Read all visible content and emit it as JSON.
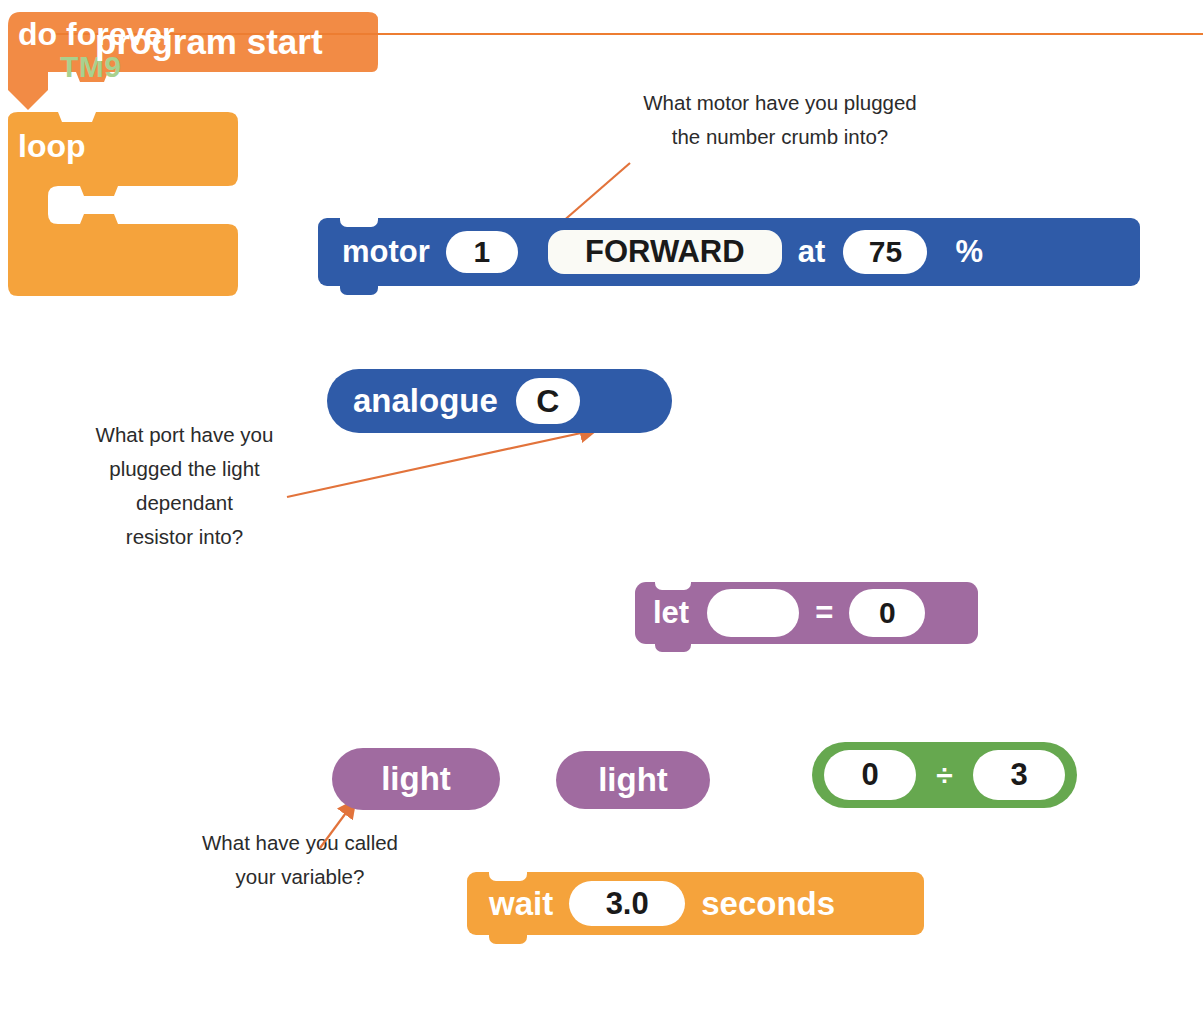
{
  "page": {
    "title": "TM9",
    "rule_color": "#ED7D31",
    "title_color": "#A9D18E",
    "background": "#ffffff"
  },
  "annotations": [
    {
      "name": "motor-question",
      "lines": [
        "What motor have you plugged",
        "the number crumb into?"
      ],
      "points_to": "motor-number-input"
    },
    {
      "name": "port-question",
      "lines": [
        "What port have you",
        "plugged the light",
        "dependant",
        "resistor into?"
      ],
      "points_to": "analogue-port-input"
    },
    {
      "name": "variable-question",
      "lines": [
        "What have you called",
        "your variable?"
      ],
      "points_to": "light-variable-block"
    }
  ],
  "blocks": {
    "motor": {
      "kind": "stack",
      "color": "#2F5BA8",
      "label": "motor",
      "number": "1",
      "direction": "FORWARD",
      "at_label": "at",
      "speed": "75",
      "percent_label": "%"
    },
    "analogue": {
      "kind": "reporter",
      "color": "#2F5BA8",
      "label": "analogue",
      "port": "C"
    },
    "program_start": {
      "kind": "hat",
      "color": "#F28B45",
      "label": "program start"
    },
    "do_forever": {
      "kind": "c-block",
      "color": "#F5A33C",
      "top_label": "do forever",
      "bottom_label": "loop"
    },
    "let": {
      "kind": "stack",
      "color": "#A06BA0",
      "label": "let",
      "variable": "",
      "equals": "=",
      "value": "0"
    },
    "light_1": {
      "kind": "reporter",
      "color": "#A06BA0",
      "label": "light"
    },
    "light_2": {
      "kind": "reporter",
      "color": "#A06BA0",
      "label": "light"
    },
    "divide": {
      "kind": "operator",
      "color": "#66A84F",
      "left": "0",
      "operator": "÷",
      "right": "3"
    },
    "wait": {
      "kind": "stack",
      "color": "#F5A33C",
      "label": "wait",
      "seconds": "3.0",
      "unit_label": "seconds"
    }
  }
}
